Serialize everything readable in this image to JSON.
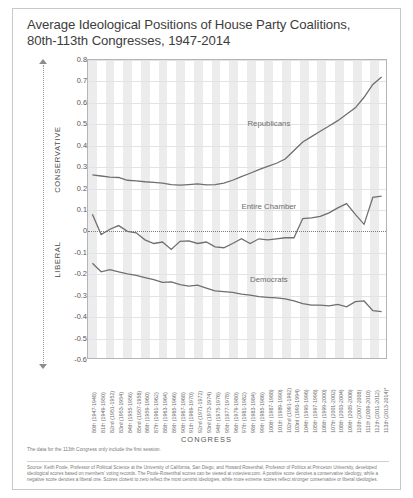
{
  "title_line1": "Average Ideological Positions of House Party Coalitions,",
  "title_line2": "80th-113th Congresses, 1947-2014",
  "axis_direction": {
    "top_label": "CONSERVATIVE",
    "bottom_label": "LIBERAL"
  },
  "xtitle": "CONGRESS",
  "footnote": "The data for the 113th Congress only include the first session.",
  "source": "Source: Keith Poole, Professor of Political Science at the University of California, San Diego, and Howard Rosenthal, Professor of Politics at Princeton University, developed ideological scores based on members' voting records. The Poole-Rosenthal scores can be viewed at voteview.com. A positive score denotes a conservative ideology, while a negative score denotes a liberal one. Scores closest to zero reflect the most centrist ideologies, while more extreme scores reflect stronger conservative or liberal ideologies.",
  "colors": {
    "line": "#6f6f6f",
    "stripe": "#ececec",
    "grid": "#e3e3e3",
    "border": "#b5b5b5",
    "text": "#4a4a4a"
  },
  "chart_data": {
    "type": "line",
    "title": "Average Ideological Positions of House Party Coalitions, 80th-113th Congresses, 1947-2014",
    "xlabel": "CONGRESS",
    "ylabel": "",
    "ylim": [
      -0.6,
      0.8
    ],
    "ytick_step": 0.1,
    "yticks": [
      "0.8",
      "0.7",
      "0.6",
      "0.5",
      "0.4",
      "0.3",
      "0.2",
      "0.1",
      "0",
      "-0.1",
      "-0.2",
      "-0.3",
      "-0.4",
      "-0.5",
      "-0.6"
    ],
    "grid": true,
    "legend": "inline-labels",
    "categories": [
      "80th (1947-1948)",
      "81th (1949-1950)",
      "82nd (1951-1952)",
      "83rd (1953-1954)",
      "84th (1955-1956)",
      "85nd (1957-1958)",
      "86th (1959-1960)",
      "87th (1961-1962)",
      "88th (1963-1964)",
      "89th (1965-1966)",
      "90th (1967-1968)",
      "91th (1969-1970)",
      "92nd (1971-1972)",
      "93rd (1973-1974)",
      "94th (1975-1976)",
      "95th (1977-1978)",
      "96th (1979-1980)",
      "97th (1981-1982)",
      "98th (1983-1984)",
      "99th (1985-1986)",
      "100th (1987-1988)",
      "101th (1989-1990)",
      "102nd (1991-1992)",
      "103rd (1993-1994)",
      "104th (1995-1996)",
      "105th (1997-1998)",
      "106th (1999-2000)",
      "107th (2001-2002)",
      "108th (2003-2004)",
      "109th (2005-2006)",
      "110th (2007-2008)",
      "111th (2009-2010)",
      "112th (2011-2012)",
      "113th (2013-2014)*"
    ],
    "series": [
      {
        "name": "Republicans",
        "values": [
          0.26,
          0.255,
          0.25,
          0.248,
          0.235,
          0.232,
          0.228,
          0.225,
          0.222,
          0.215,
          0.212,
          0.215,
          0.218,
          0.213,
          0.215,
          0.222,
          0.235,
          0.252,
          0.268,
          0.285,
          0.3,
          0.315,
          0.335,
          0.375,
          0.415,
          0.44,
          0.465,
          0.49,
          0.515,
          0.545,
          0.575,
          0.625,
          0.685,
          0.72
        ]
      },
      {
        "name": "Entire Chamber",
        "values": [
          0.075,
          -0.02,
          0.005,
          0.022,
          -0.005,
          -0.012,
          -0.045,
          -0.062,
          -0.055,
          -0.09,
          -0.052,
          -0.05,
          -0.062,
          -0.055,
          -0.078,
          -0.082,
          -0.062,
          -0.04,
          -0.062,
          -0.04,
          -0.045,
          -0.04,
          -0.035,
          -0.035,
          0.055,
          0.058,
          0.065,
          0.082,
          0.105,
          0.125,
          0.075,
          0.028,
          0.155,
          0.16
        ]
      },
      {
        "name": "Democrats",
        "values": [
          -0.155,
          -0.195,
          -0.185,
          -0.195,
          -0.205,
          -0.212,
          -0.222,
          -0.232,
          -0.245,
          -0.242,
          -0.255,
          -0.262,
          -0.258,
          -0.272,
          -0.285,
          -0.288,
          -0.292,
          -0.3,
          -0.305,
          -0.312,
          -0.315,
          -0.318,
          -0.322,
          -0.332,
          -0.345,
          -0.352,
          -0.352,
          -0.355,
          -0.348,
          -0.36,
          -0.335,
          -0.332,
          -0.378,
          -0.382
        ]
      }
    ],
    "series_label_positions": [
      {
        "name": "Republicans",
        "x_index": 20,
        "y": 0.5
      },
      {
        "name": "Entire Chamber",
        "x_index": 20,
        "y": 0.115
      },
      {
        "name": "Democrats",
        "x_index": 20,
        "y": -0.225
      }
    ]
  }
}
